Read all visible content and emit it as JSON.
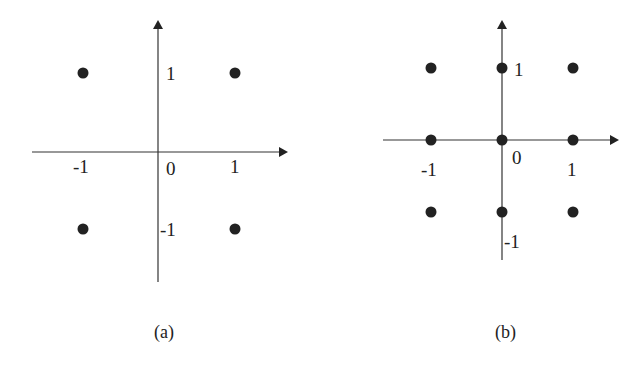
{
  "diagrams": [
    {
      "caption": "(a)",
      "axis_labels": {
        "x_neg": "-1",
        "x_pos": "1",
        "origin": "0",
        "y_pos": "1",
        "y_neg": "-1"
      },
      "points": [
        [
          -1,
          1
        ],
        [
          1,
          1
        ],
        [
          -1,
          -1
        ],
        [
          1,
          -1
        ]
      ]
    },
    {
      "caption": "(b)",
      "axis_labels": {
        "x_neg": "-1",
        "x_pos": "1",
        "origin": "0",
        "y_pos": "1",
        "y_neg": "-1"
      },
      "points": [
        [
          -1,
          1
        ],
        [
          0,
          1
        ],
        [
          1,
          1
        ],
        [
          -1,
          0
        ],
        [
          0,
          0
        ],
        [
          1,
          0
        ],
        [
          -1,
          -1
        ],
        [
          0,
          -1
        ],
        [
          1,
          -1
        ]
      ]
    }
  ],
  "colors": {
    "axis": "#333333",
    "point": "#222222",
    "text": "#222222"
  }
}
